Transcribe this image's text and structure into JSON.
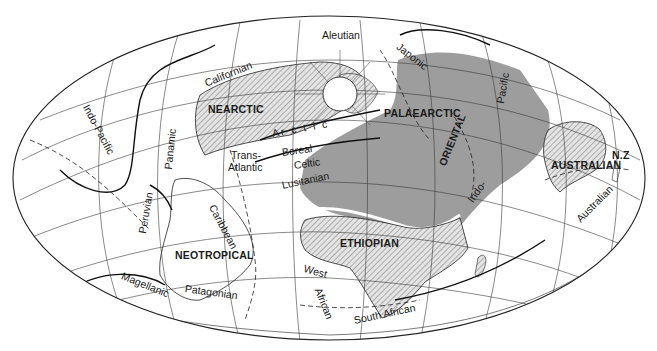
{
  "map": {
    "projection": "elliptical world map",
    "colors": {
      "background": "#ffffff",
      "ink": "#1a1a1a",
      "palaearctic_fill": "#9a9a9a",
      "hatched_fill": "#d8d8d8",
      "grid": "#333333"
    },
    "zoogeographic_realms": [
      {
        "id": "nearctic",
        "label": "NEARCTIC"
      },
      {
        "id": "palaearctic",
        "label": "PALAEARCTIC"
      },
      {
        "id": "oriental",
        "label": "ORIENTAL"
      },
      {
        "id": "ethiopian",
        "label": "ETHIOPIAN"
      },
      {
        "id": "neotropical",
        "label": "NEOTROPICAL"
      },
      {
        "id": "australian",
        "label": "AUSTRALIAN"
      },
      {
        "id": "nz",
        "label": "N.Z"
      }
    ],
    "marine_provinces": [
      {
        "id": "indo-pacific",
        "label": "Indo-Pacific"
      },
      {
        "id": "aleutian",
        "label": "Aleutian"
      },
      {
        "id": "japonic",
        "label": "Japonic"
      },
      {
        "id": "californian",
        "label": "Californian"
      },
      {
        "id": "pacific",
        "label": "Pacific"
      },
      {
        "id": "panamic",
        "label": "Panamic"
      },
      {
        "id": "arctic",
        "label": "Ar c t i c"
      },
      {
        "id": "boreal",
        "label": "Boreal"
      },
      {
        "id": "trans-atlantic",
        "label": "Trans-\nAtlantic"
      },
      {
        "id": "trans-atlantic-1",
        "label": "Trans-"
      },
      {
        "id": "trans-atlantic-2",
        "label": "Atlantic"
      },
      {
        "id": "celtic",
        "label": "Celtic"
      },
      {
        "id": "lusitanian",
        "label": "Lusitanian"
      },
      {
        "id": "indo",
        "label": "Indo-"
      },
      {
        "id": "australian-marine",
        "label": "Australian"
      },
      {
        "id": "peruvian",
        "label": "Peruvian"
      },
      {
        "id": "caribbean",
        "label": "Caribbean"
      },
      {
        "id": "magellanic",
        "label": "Magellanic"
      },
      {
        "id": "patagonian",
        "label": "Patagonian"
      },
      {
        "id": "west-african",
        "label": "West"
      },
      {
        "id": "west-african-2",
        "label": "African"
      },
      {
        "id": "south-african",
        "label": "South African"
      }
    ]
  }
}
